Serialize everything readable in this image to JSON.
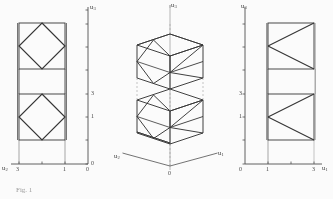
{
  "figure": {
    "caption": "Fig. 1",
    "panels": [
      {
        "id": "left-projection",
        "name": "u2-u3 projection",
        "vertical_axis": {
          "label": "u",
          "sub": "3",
          "ticks": [
            "0",
            "1",
            "3"
          ]
        },
        "horizontal_axis": {
          "label": "u",
          "sub": "2",
          "ticks": [
            "3",
            "1",
            "0"
          ]
        }
      },
      {
        "id": "middle-isometric",
        "name": "isometric view",
        "vertical_axis": {
          "label": "u",
          "sub": "3"
        },
        "left_axis": {
          "label": "u",
          "sub": "2"
        },
        "right_axis": {
          "label": "u",
          "sub": "1"
        },
        "origin": "0"
      },
      {
        "id": "right-projection",
        "name": "u1-u3 projection",
        "vertical_axis": {
          "label": "u",
          "sub": "3",
          "ticks": [
            "0",
            "1",
            "3"
          ]
        },
        "horizontal_axis": {
          "label": "u",
          "sub": "1",
          "ticks": [
            "0",
            "1",
            "3"
          ]
        }
      }
    ],
    "axis_names": {
      "u1": "u₁",
      "u2": "u₂",
      "u3": "u₃"
    },
    "colors": {
      "ink": "#2f2f2f",
      "axis": "#4a4a4a",
      "paper": "#ffffff",
      "caption": "#9a9a9a"
    }
  }
}
